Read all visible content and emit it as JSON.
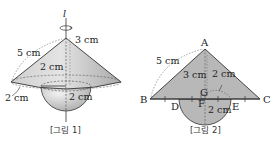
{
  "figures": [
    {
      "id": "fig1",
      "caption": "[그림 1]",
      "axis_label": "l",
      "labels": {
        "slant": "5 cm",
        "height": "3 cm",
        "hemisphere_radius_top": "2 cm",
        "rim": "2 cm",
        "hemisphere_radius": "2 cm"
      }
    },
    {
      "id": "fig2",
      "caption": "[그림 2]",
      "points": {
        "A": "A",
        "B": "B",
        "C": "C",
        "D": "D",
        "E": "E",
        "F": "F",
        "G": "G"
      },
      "labels": {
        "AB": "5 cm",
        "AF": "3 cm",
        "radius_arc": "2 cm",
        "radius_down": "2 cm"
      }
    }
  ],
  "colors": {
    "fill": "#b8b8b8",
    "fill_light": "#d6d6d6",
    "stroke": "#333333"
  }
}
